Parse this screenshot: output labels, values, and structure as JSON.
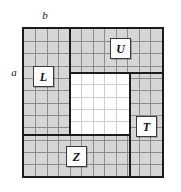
{
  "figure": {
    "axis_labels": {
      "top": "b",
      "left": "a"
    },
    "board": {
      "columns": 12,
      "rows": 12,
      "filled_color": "#d6d6d6",
      "cleared_color": "#ffffff",
      "border_color": "#1c1c1c",
      "grid_line_color": "#8c8c8c"
    },
    "cleared_region": {
      "start_col": 4,
      "start_row": 4,
      "width_cells": 5,
      "height_cells": 5
    },
    "thick_dividers": [
      {
        "orientation": "vertical",
        "col": 4,
        "from_row": 0,
        "to_row": 4
      },
      {
        "orientation": "vertical",
        "col": 4,
        "from_row": 4,
        "to_row": 9
      },
      {
        "orientation": "vertical",
        "col": 9,
        "from_row": 4,
        "to_row": 12
      },
      {
        "orientation": "horizontal",
        "row": 4,
        "from_col": 4,
        "to_col": 12
      },
      {
        "orientation": "horizontal",
        "row": 9,
        "from_col": 0,
        "to_col": 9
      }
    ],
    "tiles": [
      {
        "id": "U",
        "label": "U"
      },
      {
        "id": "L",
        "label": "L"
      },
      {
        "id": "T",
        "label": "T"
      },
      {
        "id": "Z",
        "label": "Z"
      }
    ]
  }
}
